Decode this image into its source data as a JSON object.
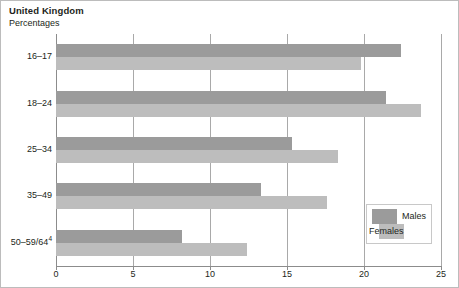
{
  "chart_data": {
    "type": "bar",
    "orientation": "horizontal",
    "title": "United Kingdom",
    "subtitle": "Percentages",
    "xlabel": "",
    "ylabel": "",
    "categories": [
      "16–17",
      "18–24",
      "25–34",
      "35–49",
      "50–59/64"
    ],
    "category_footnote_marker": "4",
    "series": [
      {
        "name": "Males",
        "color": "#9b9b9b",
        "values": [
          22.4,
          21.4,
          15.3,
          13.3,
          8.2
        ]
      },
      {
        "name": "Females",
        "color": "#bdbdbd",
        "values": [
          19.8,
          23.7,
          18.3,
          17.6,
          12.4
        ]
      }
    ],
    "xlim": [
      0,
      25
    ],
    "xticks": [
      0,
      5,
      10,
      15,
      20,
      25
    ],
    "xtick_labels": [
      "0",
      "5",
      "10",
      "15",
      "20",
      "25"
    ],
    "grid": true,
    "grid_axis": "x",
    "legend_position": "inside-lower-right"
  },
  "legend": {
    "items": [
      {
        "label": "Males"
      },
      {
        "label": "Females"
      }
    ]
  }
}
